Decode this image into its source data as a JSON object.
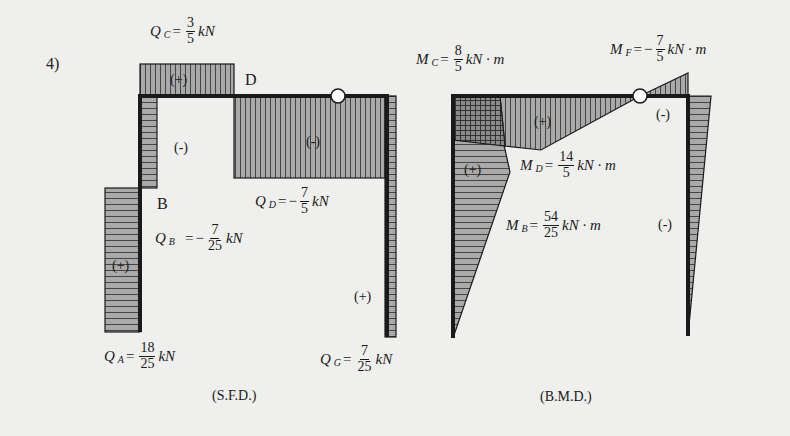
{
  "problem_number": "4)",
  "sfd": {
    "caption": "(S.F.D.)",
    "point_labels": {
      "B": "B",
      "D": "D"
    },
    "signs": {
      "top_box": "(+)",
      "column_upper": "(-)",
      "beam": "(-)",
      "column_lower": "(+)",
      "right_column": "(+)"
    },
    "values": {
      "QC": {
        "sym": "Q",
        "sub": "C",
        "eq": "=",
        "sign": "",
        "num": "3",
        "den": "5",
        "unit": "kN"
      },
      "QD": {
        "sym": "Q",
        "sub": "D",
        "eq": "=",
        "sign": "−",
        "num": "7",
        "den": "5",
        "unit": "kN"
      },
      "QB": {
        "sym": "Q",
        "sub": "B",
        "eq": "=",
        "sign": "−",
        "num": "7",
        "den": "25",
        "unit": "kN"
      },
      "QA": {
        "sym": "Q",
        "sub": "A",
        "eq": "=",
        "sign": "",
        "num": "18",
        "den": "25",
        "unit": "kN"
      },
      "QG": {
        "sym": "Q",
        "sub": "G",
        "eq": "=",
        "sign": "",
        "num": "7",
        "den": "25",
        "unit": "kN"
      }
    }
  },
  "bmd": {
    "caption": "(B.M.D.)",
    "signs": {
      "beam": "(+)",
      "left_column": "(+)",
      "near_hinge": "(-)",
      "right_column": "(-)"
    },
    "values": {
      "MC": {
        "sym": "M",
        "sub": "C",
        "eq": "=",
        "sign": "",
        "num": "8",
        "den": "5",
        "unit": "kN · m"
      },
      "MF": {
        "sym": "M",
        "sub": "F",
        "eq": "=",
        "sign": "−",
        "num": "7",
        "den": "5",
        "unit": "kN · m"
      },
      "MD": {
        "sym": "M",
        "sub": "D",
        "eq": "=",
        "sign": "",
        "num": "14",
        "den": "5",
        "unit": "kN · m"
      },
      "MB": {
        "sym": "M",
        "sub": "B",
        "eq": "=",
        "sign": "",
        "num": "54",
        "den": "25",
        "unit": "kN · m"
      }
    }
  },
  "colors": {
    "fill": "#a9a9a9",
    "fill_dark": "#7f7f7f",
    "frame": "#1a1a1a",
    "hatch": "#3a3a3a",
    "background": "#efefed"
  }
}
